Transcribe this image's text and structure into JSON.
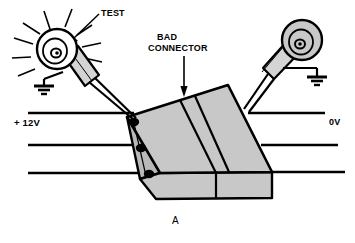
{
  "figure": {
    "id": "A",
    "caption": "A"
  },
  "labels": {
    "test": "TEST",
    "bad_connector_line1": "BAD",
    "bad_connector_line2": "CONNECTOR",
    "supply_positive": "+ 12V",
    "supply_ground": "0V"
  },
  "colors": {
    "stroke": "#000000",
    "body_fill": "#c8c8c8",
    "body_fill_dark": "#b9b9b9",
    "probe_fill": "#d4d4d4",
    "lamp_lit_fill": "#ffffff",
    "lamp_unlit_fill": "#c8c8c8",
    "background": "#ffffff"
  },
  "components": {
    "left_probe": {
      "name": "test-lamp-probe-left",
      "lamp_state": "lit",
      "rays": 9,
      "has_ground_lead": true,
      "connects_to_pin": "pin-1-top"
    },
    "right_probe": {
      "name": "test-lamp-probe-right",
      "lamp_state": "unlit",
      "rays": 0,
      "has_ground_lead": true,
      "connects_to_pin": "connector-right-edge"
    },
    "connector_block": {
      "name": "connector-block",
      "halves": 2,
      "seam": "bad-connector-seam",
      "pins_left": 3,
      "wires_right": 3
    }
  },
  "wires": {
    "left": [
      {
        "name": "wire-left-12v",
        "y": 113,
        "label": "+ 12V"
      },
      {
        "name": "wire-left-mid",
        "y": 145,
        "label": ""
      },
      {
        "name": "wire-left-low",
        "y": 173,
        "label": ""
      }
    ],
    "right": [
      {
        "name": "wire-right-0v",
        "y": 113,
        "label": "0V"
      },
      {
        "name": "wire-right-mid",
        "y": 145,
        "label": ""
      },
      {
        "name": "wire-right-low",
        "y": 172,
        "label": ""
      }
    ]
  }
}
